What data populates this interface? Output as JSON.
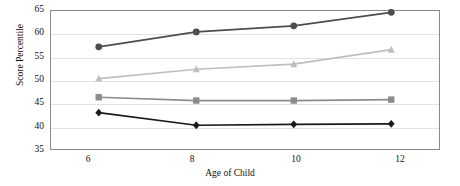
{
  "chart_data": {
    "type": "line",
    "title": "",
    "xlabel": "Age of Child",
    "ylabel": "Score Percentile",
    "categories": [
      "6",
      "8",
      "10",
      "12"
    ],
    "x": [
      6,
      8,
      10,
      12
    ],
    "xlim": [
      5,
      13
    ],
    "ylim": [
      35,
      65
    ],
    "yticks": [
      35,
      40,
      45,
      50,
      55,
      60,
      65
    ],
    "ytick_labels": [
      "35",
      "40",
      "45",
      "50",
      "55",
      "60",
      "65"
    ],
    "grid": "horizontal",
    "legend": "none",
    "series": [
      {
        "name": "series-1-dark-circle",
        "marker": "circle",
        "color": "#4d4d4d",
        "values": [
          57.1,
          60.3,
          61.6,
          64.5
        ]
      },
      {
        "name": "series-2-light-triangle",
        "marker": "triangle",
        "color": "#bfbfbf",
        "values": [
          50.3,
          52.3,
          53.4,
          56.5
        ]
      },
      {
        "name": "series-3-gray-square",
        "marker": "square",
        "color": "#8c8c8c",
        "values": [
          46.3,
          45.6,
          45.6,
          45.8
        ]
      },
      {
        "name": "series-4-black-diamond",
        "marker": "diamond",
        "color": "#1a1a1a",
        "values": [
          43.0,
          40.3,
          40.5,
          40.6
        ]
      }
    ]
  },
  "axes": {
    "y_title": "Score Percentile",
    "x_title": "Age of Child",
    "y_tick_labels": [
      "65",
      "60",
      "55",
      "50",
      "45",
      "40",
      "35"
    ],
    "x_tick_labels": [
      "6",
      "8",
      "10",
      "12"
    ]
  },
  "colors": {
    "frame": "#8a8a8a",
    "gridline": "#e2e2e2",
    "background": "#ffffff",
    "text": "#111111"
  }
}
